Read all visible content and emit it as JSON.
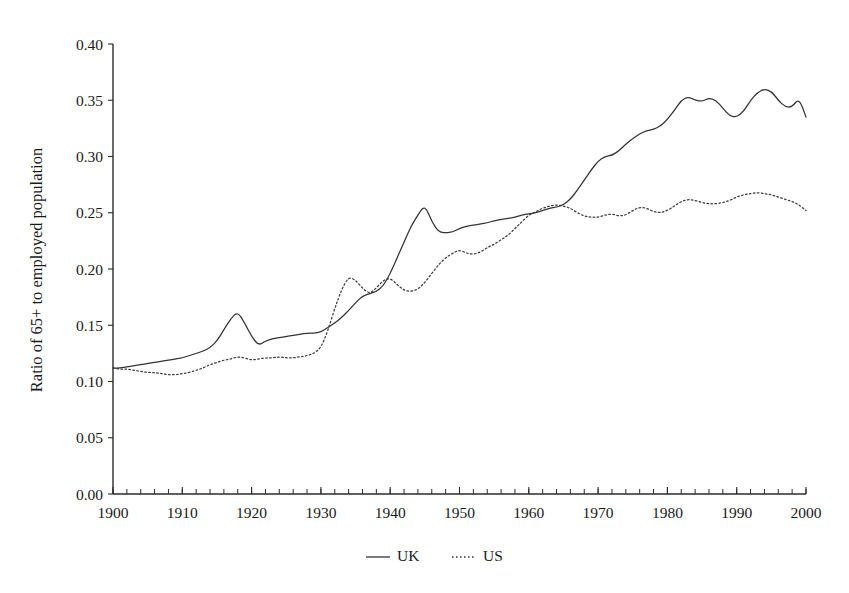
{
  "chart_data": {
    "type": "line",
    "title": "",
    "xlabel": "",
    "ylabel": "Ratio of 65+ to employed population",
    "xlim": [
      1900,
      2000
    ],
    "ylim": [
      0.0,
      0.4
    ],
    "grid": false,
    "legend_position": "bottom-center",
    "x_tick_labels": [
      "1900",
      "1910",
      "1920",
      "1930",
      "1940",
      "1950",
      "1960",
      "1970",
      "1980",
      "1990",
      "2000"
    ],
    "x_tick_values": [
      1900,
      1910,
      1920,
      1930,
      1940,
      1950,
      1960,
      1970,
      1980,
      1990,
      2000
    ],
    "x_minor_tick_step": 2,
    "y_tick_labels": [
      "0.00",
      "0.05",
      "0.10",
      "0.15",
      "0.20",
      "0.25",
      "0.30",
      "0.35",
      "0.40"
    ],
    "y_tick_values": [
      0.0,
      0.05,
      0.1,
      0.15,
      0.2,
      0.25,
      0.3,
      0.35,
      0.4
    ],
    "x": [
      1900,
      1901,
      1902,
      1903,
      1904,
      1905,
      1906,
      1907,
      1908,
      1909,
      1910,
      1911,
      1912,
      1913,
      1914,
      1915,
      1916,
      1917,
      1918,
      1919,
      1920,
      1921,
      1922,
      1923,
      1924,
      1925,
      1926,
      1927,
      1928,
      1929,
      1930,
      1931,
      1932,
      1933,
      1934,
      1935,
      1936,
      1937,
      1938,
      1939,
      1940,
      1941,
      1942,
      1943,
      1944,
      1945,
      1946,
      1947,
      1948,
      1949,
      1950,
      1951,
      1952,
      1953,
      1954,
      1955,
      1956,
      1957,
      1958,
      1959,
      1960,
      1961,
      1962,
      1963,
      1964,
      1965,
      1966,
      1967,
      1968,
      1969,
      1970,
      1971,
      1972,
      1973,
      1974,
      1975,
      1976,
      1977,
      1978,
      1979,
      1980,
      1981,
      1982,
      1983,
      1984,
      1985,
      1986,
      1987,
      1988,
      1989,
      1990,
      1991,
      1992,
      1993,
      1994,
      1995,
      1996,
      1997,
      1998,
      1999,
      2000
    ],
    "series": [
      {
        "name": "UK",
        "style": "solid",
        "color": "#333333",
        "values": [
          0.112,
          0.112,
          0.113,
          0.114,
          0.115,
          0.116,
          0.117,
          0.118,
          0.119,
          0.12,
          0.121,
          0.123,
          0.125,
          0.127,
          0.13,
          0.136,
          0.146,
          0.156,
          0.162,
          0.152,
          0.14,
          0.132,
          0.136,
          0.138,
          0.139,
          0.14,
          0.141,
          0.142,
          0.143,
          0.143,
          0.144,
          0.148,
          0.152,
          0.157,
          0.163,
          0.17,
          0.176,
          0.178,
          0.18,
          0.185,
          0.196,
          0.21,
          0.224,
          0.238,
          0.248,
          0.257,
          0.242,
          0.233,
          0.232,
          0.233,
          0.236,
          0.238,
          0.239,
          0.24,
          0.241,
          0.243,
          0.244,
          0.245,
          0.246,
          0.248,
          0.249,
          0.25,
          0.252,
          0.254,
          0.255,
          0.257,
          0.262,
          0.27,
          0.279,
          0.288,
          0.296,
          0.3,
          0.301,
          0.305,
          0.311,
          0.316,
          0.32,
          0.323,
          0.324,
          0.327,
          0.333,
          0.341,
          0.35,
          0.353,
          0.35,
          0.349,
          0.352,
          0.35,
          0.343,
          0.336,
          0.335,
          0.34,
          0.35,
          0.357,
          0.36,
          0.358,
          0.35,
          0.344,
          0.344,
          0.352,
          0.335
        ]
      },
      {
        "name": "US",
        "style": "dotted",
        "color": "#3a3a3a",
        "values": [
          0.112,
          0.111,
          0.111,
          0.11,
          0.109,
          0.108,
          0.108,
          0.107,
          0.106,
          0.106,
          0.107,
          0.108,
          0.11,
          0.112,
          0.115,
          0.117,
          0.119,
          0.12,
          0.122,
          0.121,
          0.119,
          0.12,
          0.121,
          0.121,
          0.122,
          0.121,
          0.121,
          0.122,
          0.123,
          0.125,
          0.13,
          0.145,
          0.165,
          0.182,
          0.193,
          0.19,
          0.183,
          0.178,
          0.183,
          0.19,
          0.192,
          0.186,
          0.181,
          0.18,
          0.182,
          0.188,
          0.196,
          0.204,
          0.21,
          0.214,
          0.217,
          0.214,
          0.213,
          0.215,
          0.219,
          0.222,
          0.226,
          0.23,
          0.236,
          0.242,
          0.248,
          0.251,
          0.254,
          0.256,
          0.257,
          0.256,
          0.254,
          0.25,
          0.247,
          0.246,
          0.246,
          0.248,
          0.249,
          0.247,
          0.248,
          0.252,
          0.255,
          0.254,
          0.251,
          0.25,
          0.252,
          0.256,
          0.26,
          0.262,
          0.261,
          0.259,
          0.258,
          0.258,
          0.259,
          0.261,
          0.264,
          0.266,
          0.267,
          0.268,
          0.267,
          0.266,
          0.264,
          0.262,
          0.26,
          0.257,
          0.252
        ]
      }
    ],
    "legend": [
      {
        "label": "UK",
        "style": "solid"
      },
      {
        "label": "US",
        "style": "dotted"
      }
    ]
  }
}
